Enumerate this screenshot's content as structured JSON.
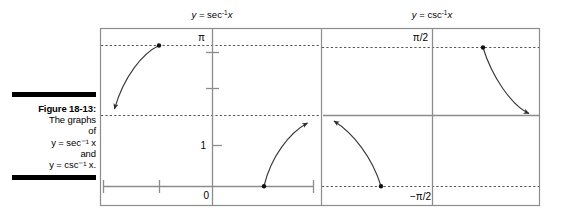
{
  "figure": {
    "caption": {
      "label": "Figure 18-13:",
      "lines": [
        "The graphs",
        "of",
        "y = sec⁻¹ x",
        "and",
        "y = csc⁻¹ x."
      ],
      "rule_color": "#000000"
    },
    "frame": {
      "border_color": "#808080",
      "divider_x": 321,
      "left": 100,
      "right": 540,
      "top": 28,
      "bottom": 205
    },
    "panels": [
      {
        "id": "sec-inverse",
        "title": "y = sec",
        "title_sup": "-1",
        "title_var": "x",
        "title_full": "y = sec⁻¹x",
        "y_axis_labels": [
          {
            "text": "π",
            "x": 205,
            "y": 41
          },
          {
            "text": "1",
            "x": 201,
            "y": 149
          },
          {
            "text": "0",
            "x": 204,
            "y": 198
          }
        ],
        "asymptotes": [
          {
            "name": "pi-asymptote",
            "y": 45
          },
          {
            "name": "pi-over-2-asymptote",
            "y": 115
          }
        ],
        "branches": [
          {
            "name": "left-branch",
            "dot": {
              "x": 159,
              "y": 45
            },
            "arrow": {
              "x": 111,
              "y": 113
            },
            "path": "M 159 45 C 142 52 122 78 113 110"
          },
          {
            "name": "right-branch",
            "dot": {
              "x": 264,
              "y": 186
            },
            "arrow": {
              "x": 312,
              "y": 119
            },
            "path": "M 264 186 C 272 156 290 132 310 122"
          }
        ]
      },
      {
        "id": "csc-inverse",
        "title": "y = csc",
        "title_sup": "-1",
        "title_var": "x",
        "title_full": "y = csc⁻¹x",
        "y_axis_labels": [
          {
            "text": "π/2",
            "x": 412,
            "y": 41
          },
          {
            "text": "−π/2",
            "x": 407,
            "y": 199
          }
        ],
        "asymptotes": [
          {
            "name": "pi-over-2-asymptote",
            "y": 47
          },
          {
            "name": "neg-pi-over-2-asymptote",
            "y": 186
          }
        ],
        "branches": [
          {
            "name": "lower-left-branch",
            "dot": {
              "x": 381,
              "y": 186
            },
            "arrow": {
              "x": 330,
              "y": 118
            },
            "path": "M 381 186 C 372 156 352 132 332 121"
          },
          {
            "name": "upper-right-branch",
            "dot": {
              "x": 483,
              "y": 47
            },
            "arrow": {
              "x": 532,
              "y": 118
            },
            "path": "M 483 47 C 492 78 512 108 530 116"
          }
        ]
      }
    ],
    "colors": {
      "curve": "#3a3a3a",
      "axis": "#8c8c8c",
      "frame": "#8c8c8c",
      "dotted": "#555555",
      "text": "#000000"
    }
  }
}
